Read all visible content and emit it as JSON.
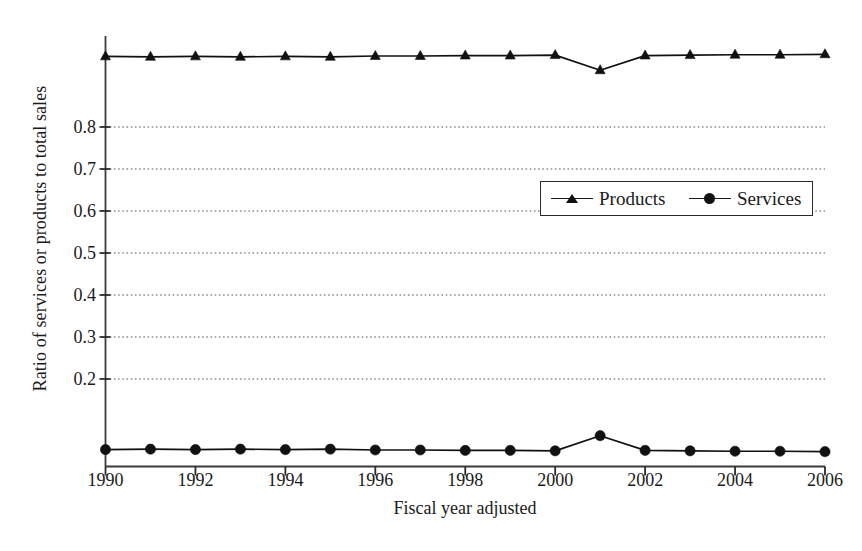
{
  "chart_data": {
    "type": "line",
    "title": "",
    "xlabel": "Fiscal year adjusted",
    "ylabel": "Ratio of services or products to total sales",
    "x": [
      1990,
      1991,
      1992,
      1993,
      1994,
      1995,
      1996,
      1997,
      1998,
      1999,
      2000,
      2001,
      2002,
      2003,
      2004,
      2005,
      2006
    ],
    "xtick_labels": [
      "1990",
      "1992",
      "1994",
      "1996",
      "1998",
      "2000",
      "2002",
      "2004",
      "2006"
    ],
    "xticks": [
      1990,
      1992,
      1994,
      1996,
      1998,
      2000,
      2002,
      2004,
      2006
    ],
    "ytick_labels": [
      "0.2",
      "0.3",
      "0.4",
      "0.5",
      "0.6",
      "0.7",
      "0.8"
    ],
    "yticks": [
      0.2,
      0.3,
      0.4,
      0.5,
      0.6,
      0.7,
      0.8
    ],
    "xlim": [
      1990,
      2006
    ],
    "ylim": [
      0.0,
      1.01
    ],
    "grid": "horizontal-dotted",
    "legend_position": "center-right",
    "series": [
      {
        "name": "Products",
        "marker": "triangle",
        "color": "#111111",
        "values": [
          0.968,
          0.967,
          0.968,
          0.967,
          0.968,
          0.967,
          0.969,
          0.969,
          0.97,
          0.97,
          0.971,
          0.935,
          0.97,
          0.971,
          0.972,
          0.972,
          0.973
        ]
      },
      {
        "name": "Services",
        "marker": "circle",
        "color": "#111111",
        "values": [
          0.032,
          0.033,
          0.032,
          0.033,
          0.032,
          0.033,
          0.031,
          0.031,
          0.03,
          0.03,
          0.029,
          0.065,
          0.03,
          0.029,
          0.028,
          0.028,
          0.027
        ]
      }
    ]
  },
  "legend": {
    "products_label": "Products",
    "services_label": "Services"
  },
  "axes": {
    "xlabel": "Fiscal year adjusted",
    "ylabel": "Ratio of services or products to total sales"
  }
}
